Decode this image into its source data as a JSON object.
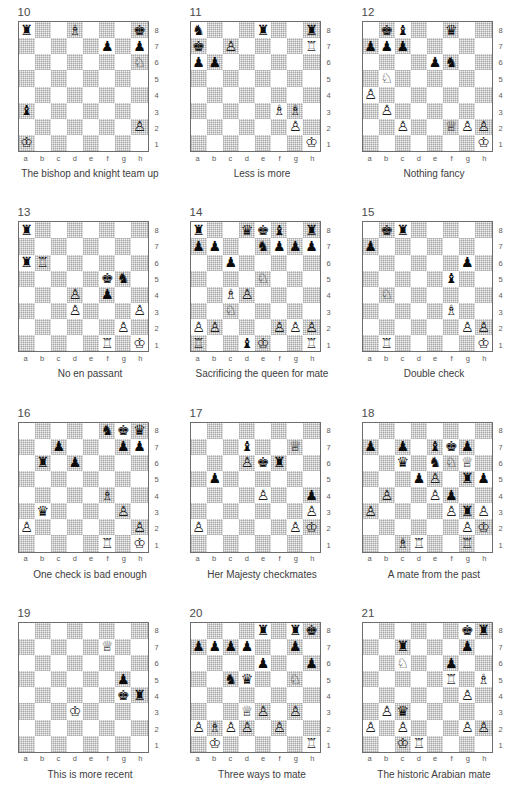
{
  "page": {
    "header": "",
    "columns": 3,
    "rows": 4,
    "file_labels": [
      "a",
      "b",
      "c",
      "d",
      "e",
      "f",
      "g",
      "h"
    ],
    "rank_labels": [
      "8",
      "7",
      "6",
      "5",
      "4",
      "3",
      "2",
      "1"
    ],
    "glyphs": {
      "wK": "♔",
      "wQ": "♕",
      "wR": "♖",
      "wB": "♗",
      "wN": "♘",
      "wP": "♙",
      "bK": "♚",
      "bQ": "♛",
      "bR": "♜",
      "bB": "♝",
      "bN": "♞",
      "bP": "♟"
    },
    "colors": {
      "board_border": "#6d6d6d",
      "dark_square": "#e8e8e8",
      "light_square": "#ffffff",
      "text": "#3d3d3d",
      "coord_text": "#5a5a5a"
    }
  },
  "diagrams": [
    {
      "number": "10",
      "caption": "The bishop and knight team up",
      "pieces": {
        "a8": "bR",
        "d8": "wB",
        "h8": "bK",
        "f7": "bP",
        "h7": "bP",
        "h6": "wN",
        "a3": "bB",
        "h2": "wP",
        "a1": "wK"
      }
    },
    {
      "number": "11",
      "caption": "Less is more",
      "pieces": {
        "a8": "bN",
        "e8": "bR",
        "h8": "bR",
        "a7": "bK",
        "c7": "wP",
        "h7": "wR",
        "a6": "bP",
        "b6": "bP",
        "f3": "wB",
        "g3": "wB",
        "g2": "wP",
        "h1": "wK"
      }
    },
    {
      "number": "12",
      "caption": "Nothing fancy",
      "pieces": {
        "b8": "bK",
        "c8": "bB",
        "f8": "bQ",
        "a7": "bP",
        "b7": "bP",
        "c7": "bP",
        "e6": "bP",
        "f6": "bN",
        "b5": "wN",
        "a4": "wP",
        "b3": "wP",
        "c2": "wP",
        "f2": "wQ",
        "g2": "wP",
        "h2": "wP",
        "h1": "wK"
      }
    },
    {
      "number": "13",
      "caption": "No en passant",
      "pieces": {
        "a8": "bR",
        "a6": "bR",
        "b6": "wR",
        "f5": "bK",
        "g5": "bN",
        "d4": "wP",
        "f4": "bP",
        "d3": "wP",
        "h3": "wP",
        "g2": "wP",
        "f1": "wR",
        "h1": "wK"
      }
    },
    {
      "number": "14",
      "caption": "Sacrificing the queen for mate",
      "pieces": {
        "a8": "bR",
        "d8": "bQ",
        "e8": "bK",
        "f8": "bB",
        "h8": "bR",
        "a7": "bP",
        "b7": "bP",
        "e7": "bN",
        "f7": "bP",
        "g7": "bP",
        "h7": "bP",
        "c6": "bP",
        "e5": "wN",
        "c4": "wB",
        "d4": "wP",
        "c3": "wN",
        "a2": "wP",
        "b2": "wP",
        "f2": "wP",
        "g2": "wP",
        "h2": "wP",
        "a1": "wR",
        "d1": "bB",
        "e1": "wK",
        "h1": "wR"
      }
    },
    {
      "number": "15",
      "caption": "Double check",
      "pieces": {
        "b8": "bK",
        "c8": "bR",
        "a7": "bP",
        "g6": "bP",
        "f5": "bB",
        "b4": "wN",
        "f3": "wB",
        "g2": "wP",
        "h2": "wP",
        "b1": "wR",
        "h1": "wK"
      }
    },
    {
      "number": "16",
      "caption": "One check is bad enough",
      "pieces": {
        "f8": "bN",
        "g8": "bK",
        "h8": "bQ",
        "c7": "bP",
        "g7": "bP",
        "h7": "bP",
        "b6": "bR",
        "d6": "bP",
        "f4": "wB",
        "b3": "bQ",
        "g3": "wP",
        "a2": "wP",
        "h2": "wP",
        "f1": "wR",
        "h1": "wK"
      }
    },
    {
      "number": "17",
      "caption": "Her Majesty checkmates",
      "pieces": {
        "d7": "bB",
        "g7": "wQ",
        "d6": "wP",
        "e6": "bK",
        "f6": "bR",
        "b5": "bP",
        "e4": "wP",
        "h4": "bP",
        "h3": "wP",
        "a2": "wP",
        "g2": "wP",
        "h2": "wK"
      }
    },
    {
      "number": "18",
      "caption": "A mate from the past",
      "pieces": {
        "a7": "bP",
        "c7": "bP",
        "e7": "bB",
        "f7": "bK",
        "g7": "bP",
        "c6": "bQ",
        "e6": "bN",
        "f6": "wN",
        "g6": "wQ",
        "d5": "bP",
        "e5": "wP",
        "g5": "bR",
        "h5": "bP",
        "b4": "wP",
        "e4": "wP",
        "f4": "bP",
        "a3": "wP",
        "f3": "wP",
        "g3": "bR",
        "h3": "wP",
        "g2": "wP",
        "h2": "wK",
        "c1": "wB",
        "d1": "wR",
        "g1": "wR"
      }
    },
    {
      "number": "19",
      "caption": "This is more recent",
      "pieces": {
        "f7": "wQ",
        "g5": "bP",
        "g4": "bK",
        "h4": "bR",
        "d3": "wK"
      }
    },
    {
      "number": "20",
      "caption": "Three ways to mate",
      "pieces": {
        "e8": "bR",
        "g8": "bR",
        "h8": "bK",
        "a7": "bP",
        "b7": "bP",
        "c7": "bP",
        "d7": "bP",
        "g7": "bP",
        "e6": "bP",
        "h6": "bP",
        "c5": "bN",
        "d5": "bQ",
        "g5": "wN",
        "d3": "wQ",
        "e3": "wP",
        "g3": "wP",
        "a2": "wP",
        "b2": "wB",
        "c2": "wP",
        "d2": "wP",
        "f2": "wP",
        "b1": "wK",
        "h1": "wR"
      }
    },
    {
      "number": "21",
      "caption": "The historic Arabian mate",
      "pieces": {
        "g8": "bK",
        "h8": "bR",
        "c7": "bR",
        "g7": "bP",
        "c6": "wN",
        "f6": "bP",
        "f5": "wR",
        "h5": "wB",
        "g4": "wP",
        "b3": "wP",
        "c3": "bQ",
        "a2": "wP",
        "c2": "wP",
        "g2": "wP",
        "h2": "wP",
        "c1": "wK",
        "d1": "wR"
      }
    }
  ]
}
